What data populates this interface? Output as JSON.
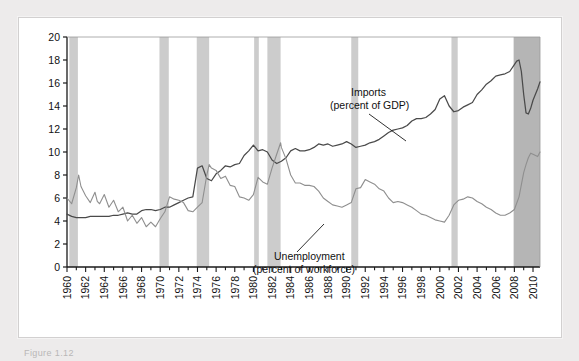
{
  "caption": "Figure  1.12",
  "colors": {
    "imports_line": "#4a4a4a",
    "unemployment_line": "#8f8f8f",
    "recession_band": "#cccccc",
    "recession_band_dark": "#b5b5b5",
    "axis": "#1a1a1a",
    "panel_bg": "#ffffff",
    "page_bg": "#edebeb"
  },
  "annotations": {
    "imports": {
      "line1": "Imports",
      "line2": "(percent of GDP)"
    },
    "unemployment": {
      "line1": "Unemployment",
      "line2": "(percent of workforce)"
    }
  },
  "chart_data": {
    "type": "line",
    "title": "",
    "xlabel": "",
    "ylabel": "",
    "xlim": [
      1960,
      2010.75
    ],
    "ylim": [
      0,
      20
    ],
    "grid": false,
    "legend": "annotations-inline",
    "ytick_labels": [
      "0",
      "2",
      "4",
      "6",
      "8",
      "10",
      "12",
      "14",
      "16",
      "18",
      "20"
    ],
    "yticks": [
      0,
      2,
      4,
      6,
      8,
      10,
      12,
      14,
      16,
      18,
      20
    ],
    "xtick_labels": [
      "1960",
      "1962",
      "1964",
      "1966",
      "1968",
      "1970",
      "1972",
      "1974",
      "1976",
      "1978",
      "1980",
      "1982",
      "1984",
      "1986",
      "1988",
      "1990",
      "1992",
      "1994",
      "1996",
      "1998",
      "2000",
      "2002",
      "2004",
      "2006",
      "2008",
      "2010"
    ],
    "xticks": [
      1960,
      1962,
      1964,
      1966,
      1968,
      1970,
      1972,
      1974,
      1976,
      1978,
      1980,
      1982,
      1984,
      1986,
      1988,
      1990,
      1992,
      1994,
      1996,
      1998,
      2000,
      2002,
      2004,
      2006,
      2008,
      2010
    ],
    "xtick_minor_step": 1,
    "recession_bands": [
      {
        "start": 1960.25,
        "end": 1961.17
      },
      {
        "start": 1969.92,
        "end": 1970.92
      },
      {
        "start": 1973.92,
        "end": 1975.25
      },
      {
        "start": 1980.08,
        "end": 1980.58
      },
      {
        "start": 1981.5,
        "end": 1982.92
      },
      {
        "start": 1990.5,
        "end": 1991.25
      },
      {
        "start": 2001.25,
        "end": 2001.92
      },
      {
        "start": 2007.92,
        "end": 2010.75,
        "dark": true
      }
    ],
    "series": [
      {
        "name": "Imports (percent of GDP)",
        "color": "#4a4a4a",
        "x": [
          1960,
          1960.5,
          1961,
          1961.5,
          1962,
          1962.5,
          1963,
          1963.5,
          1964,
          1964.5,
          1965,
          1965.5,
          1966,
          1966.5,
          1967,
          1967.5,
          1968,
          1968.5,
          1969,
          1969.5,
          1970,
          1970.5,
          1971,
          1971.5,
          1972,
          1972.5,
          1973,
          1973.5,
          1974,
          1974.5,
          1975,
          1975.5,
          1976,
          1976.5,
          1977,
          1977.5,
          1978,
          1978.5,
          1979,
          1979.5,
          1980,
          1980.5,
          1981,
          1981.5,
          1982,
          1982.5,
          1983,
          1983.5,
          1984,
          1984.5,
          1985,
          1985.5,
          1986,
          1986.5,
          1987,
          1987.5,
          1988,
          1988.5,
          1989,
          1989.5,
          1990,
          1990.5,
          1991,
          1991.5,
          1992,
          1992.5,
          1993,
          1993.5,
          1994,
          1994.5,
          1995,
          1995.5,
          1996,
          1996.5,
          1997,
          1997.5,
          1998,
          1998.5,
          1999,
          1999.5,
          2000,
          2000.5,
          2001,
          2001.5,
          2002,
          2002.5,
          2003,
          2003.5,
          2004,
          2004.5,
          2005,
          2005.5,
          2006,
          2006.5,
          2007,
          2007.5,
          2008,
          2008.25,
          2008.5,
          2008.75,
          2009,
          2009.25,
          2009.5,
          2009.75,
          2010,
          2010.5,
          2010.75
        ],
        "y": [
          4.6,
          4.4,
          4.3,
          4.3,
          4.3,
          4.4,
          4.4,
          4.4,
          4.4,
          4.4,
          4.5,
          4.5,
          4.6,
          4.7,
          4.6,
          4.6,
          4.9,
          5.0,
          5.0,
          4.9,
          5.0,
          5.2,
          5.2,
          5.4,
          5.6,
          5.8,
          6.0,
          6.1,
          8.6,
          8.8,
          7.7,
          7.5,
          8.1,
          8.4,
          8.8,
          8.7,
          8.9,
          9.0,
          9.7,
          10.1,
          10.6,
          10.1,
          10.2,
          10.0,
          9.3,
          9.0,
          9.2,
          9.5,
          10.1,
          10.3,
          10.1,
          10.1,
          10.2,
          10.4,
          10.7,
          10.6,
          10.7,
          10.5,
          10.6,
          10.7,
          10.9,
          10.7,
          10.4,
          10.5,
          10.6,
          10.8,
          10.9,
          11.1,
          11.4,
          11.7,
          11.9,
          12.0,
          12.1,
          12.3,
          12.7,
          12.9,
          12.9,
          13.0,
          13.3,
          13.7,
          14.6,
          14.9,
          14.0,
          13.5,
          13.6,
          13.9,
          14.1,
          14.3,
          15.0,
          15.4,
          15.9,
          16.2,
          16.6,
          16.7,
          16.8,
          17.0,
          17.6,
          17.9,
          18.0,
          17.0,
          15.0,
          13.4,
          13.3,
          13.8,
          14.5,
          15.5,
          16.1
        ]
      },
      {
        "name": "Unemployment (percent of workforce)",
        "color": "#8f8f8f",
        "x": [
          1960,
          1960.5,
          1961,
          1961.25,
          1961.5,
          1962,
          1962.5,
          1963,
          1963.25,
          1963.5,
          1964,
          1964.5,
          1965,
          1965.5,
          1966,
          1966.5,
          1967,
          1967.5,
          1968,
          1968.5,
          1969,
          1969.5,
          1970,
          1970.5,
          1971,
          1971.5,
          1972,
          1972.5,
          1973,
          1973.5,
          1974,
          1974.5,
          1975,
          1975.25,
          1975.5,
          1976,
          1976.5,
          1977,
          1977.5,
          1978,
          1978.5,
          1979,
          1979.5,
          1980,
          1980.5,
          1981,
          1981.5,
          1982,
          1982.5,
          1982.92,
          1983,
          1983.5,
          1984,
          1984.5,
          1985,
          1985.5,
          1986,
          1986.5,
          1987,
          1987.5,
          1988,
          1988.5,
          1989,
          1989.5,
          1990,
          1990.5,
          1991,
          1991.5,
          1992,
          1992.5,
          1993,
          1993.5,
          1994,
          1994.5,
          1995,
          1995.5,
          1996,
          1996.5,
          1997,
          1997.5,
          1998,
          1998.5,
          1999,
          1999.5,
          2000,
          2000.5,
          2001,
          2001.5,
          2002,
          2002.5,
          2003,
          2003.5,
          2004,
          2004.5,
          2005,
          2005.5,
          2006,
          2006.5,
          2007,
          2007.5,
          2008,
          2008.5,
          2009,
          2009.25,
          2009.5,
          2009.75,
          2010,
          2010.5,
          2010.75
        ],
        "y": [
          6.0,
          5.5,
          6.9,
          8.0,
          7.0,
          6.2,
          5.6,
          6.5,
          5.7,
          5.5,
          6.3,
          5.2,
          5.8,
          4.8,
          5.2,
          4.0,
          4.5,
          3.8,
          4.3,
          3.5,
          3.9,
          3.5,
          4.2,
          4.8,
          6.1,
          5.9,
          5.8,
          5.6,
          4.9,
          4.8,
          5.2,
          5.6,
          8.0,
          8.9,
          8.6,
          8.4,
          7.7,
          7.9,
          7.1,
          7.0,
          6.1,
          6.0,
          5.8,
          6.3,
          7.8,
          7.4,
          7.2,
          8.6,
          9.8,
          10.8,
          10.4,
          9.4,
          8.0,
          7.3,
          7.3,
          7.1,
          7.1,
          7.0,
          6.6,
          6.0,
          5.7,
          5.4,
          5.3,
          5.2,
          5.4,
          5.6,
          6.8,
          6.9,
          7.6,
          7.4,
          7.2,
          6.8,
          6.6,
          6.0,
          5.6,
          5.7,
          5.6,
          5.4,
          5.2,
          4.9,
          4.6,
          4.5,
          4.3,
          4.1,
          4.0,
          3.9,
          4.5,
          5.4,
          5.8,
          5.9,
          6.1,
          6.0,
          5.7,
          5.5,
          5.2,
          5.0,
          4.7,
          4.5,
          4.5,
          4.7,
          5.0,
          6.1,
          8.2,
          8.9,
          9.5,
          9.9,
          9.8,
          9.6,
          10.0
        ]
      }
    ]
  }
}
